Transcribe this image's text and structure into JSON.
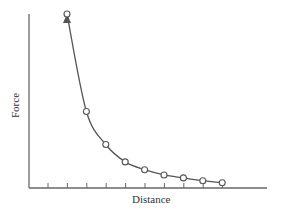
{
  "chart_data": {
    "type": "line",
    "title": "",
    "xlabel": "Distance",
    "ylabel": "Force",
    "x": [
      1,
      2,
      3,
      4,
      5,
      6,
      7,
      8,
      9
    ],
    "values": [
      100,
      44,
      25,
      15,
      10.5,
      7.5,
      5.8,
      4.2,
      3
    ],
    "xlim": [
      0,
      12
    ],
    "ylim": [
      0,
      100
    ],
    "grid": false,
    "legend": null,
    "markers": "open-circle",
    "arrow_at_first_point": true,
    "tick_labels_shown": false,
    "x_tick_count": 10,
    "colors": {
      "line": "#555555",
      "axis": "#666666"
    }
  }
}
